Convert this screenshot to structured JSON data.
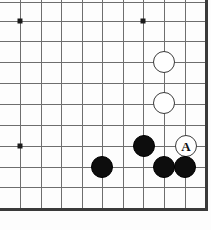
{
  "diagram": {
    "kind": "go-board-diagram",
    "corner": "bottom-right",
    "board_width_px": 211,
    "board_height_px": 230,
    "grid_spacing_px": 20.6,
    "origin_x_px": 20,
    "origin_y_px": 2,
    "columns": 10,
    "rows": 11,
    "colors": {
      "background": "#fdfdfd",
      "grid_line": "#6e6e6e",
      "edge_line": "#3a3a3a",
      "black_stone": "#0d0d0d",
      "white_stone": "#ffffff",
      "white_stone_border": "#3a3a3a",
      "star_point": "#1a1a1a"
    }
  },
  "grid": {
    "horizontal_lines_y": [
      2,
      21,
      41,
      62,
      83,
      104,
      125,
      146,
      167,
      187
    ],
    "vertical_lines_x": [
      20,
      41,
      61,
      82,
      102,
      123,
      143,
      164,
      185
    ],
    "bottom_edge_y": 208,
    "right_edge_x": 205
  },
  "star_points": [
    {
      "name": "star-point-top-left",
      "x": 20,
      "y": 21
    },
    {
      "name": "star-point-top-right",
      "x": 143,
      "y": 21
    },
    {
      "name": "star-point-left",
      "x": 20,
      "y": 146
    }
  ],
  "stones": [
    {
      "name": "white-stone-upper",
      "color": "white",
      "x": 164,
      "y": 62,
      "radius": 11,
      "label": ""
    },
    {
      "name": "white-stone-lower",
      "color": "white",
      "x": 164,
      "y": 103,
      "radius": 11,
      "label": ""
    },
    {
      "name": "black-stone-center",
      "color": "black",
      "x": 144,
      "y": 146,
      "radius": 11,
      "label": ""
    },
    {
      "name": "white-stone-marked-a",
      "color": "white",
      "x": 186,
      "y": 146,
      "radius": 11,
      "label": "A"
    },
    {
      "name": "black-stone-left",
      "color": "black",
      "x": 102,
      "y": 167,
      "radius": 11,
      "label": ""
    },
    {
      "name": "black-stone-bottom-mid",
      "color": "black",
      "x": 164,
      "y": 167,
      "radius": 11,
      "label": ""
    },
    {
      "name": "black-stone-bottom-right",
      "color": "black",
      "x": 185,
      "y": 167,
      "radius": 11,
      "label": ""
    }
  ],
  "labels": {
    "marked_point": "A"
  }
}
